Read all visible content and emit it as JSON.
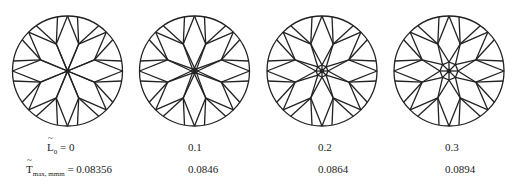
{
  "figure": {
    "panels": [
      {
        "cx": 67.5,
        "cy": 71,
        "r": 55,
        "L0": "0",
        "inner_offset": 0,
        "Tmax": "0.08356"
      },
      {
        "cx": 194.5,
        "cy": 71,
        "r": 55,
        "L0": "0.1",
        "inner_offset": 3,
        "Tmax": "0.0846"
      },
      {
        "cx": 322,
        "cy": 71,
        "r": 55,
        "L0": "0.2",
        "inner_offset": 6,
        "Tmax": "0.0864"
      },
      {
        "cx": 449,
        "cy": 71,
        "r": 55,
        "L0": "0.3",
        "inner_offset": 9,
        "Tmax": "0.0894"
      }
    ],
    "row1": {
      "symbol": "L",
      "subscript": "0",
      "first_value": "= 0",
      "values": [
        "0.1",
        "0.2",
        "0.3"
      ]
    },
    "row2": {
      "symbol": "T",
      "subscript": "max, mmm",
      "first_value": "= 0.08356",
      "values": [
        "0.0846",
        "0.0864",
        "0.0894"
      ]
    },
    "stroke_color": "#222222"
  }
}
